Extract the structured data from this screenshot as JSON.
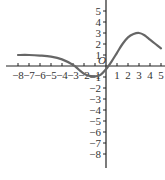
{
  "chart_data": {
    "type": "line",
    "title": "",
    "xlabel": "",
    "ylabel": "",
    "origin_label": "O",
    "xlim": [
      -8,
      5
    ],
    "ylim": [
      -8,
      5
    ],
    "x_ticks": [
      -8,
      -7,
      -6,
      -5,
      -4,
      -3,
      -2,
      -1,
      1,
      2,
      3,
      4,
      5
    ],
    "y_ticks": [
      -8,
      -7,
      -6,
      -5,
      -4,
      -3,
      -2,
      -1,
      1,
      2,
      3,
      4,
      5
    ],
    "grid": false,
    "series": [
      {
        "name": "f(x)",
        "x": [
          -8,
          -7,
          -6,
          -5,
          -4,
          -3,
          -2.5,
          -2,
          -1.5,
          -1,
          -0.5,
          0,
          0.5,
          1,
          1.5,
          2,
          2.5,
          3,
          3.5,
          4,
          4.5,
          5
        ],
        "y": [
          1,
          1,
          0.95,
          0.85,
          0.6,
          0.1,
          -0.3,
          -0.7,
          -0.9,
          -0.95,
          -0.8,
          -0.3,
          0.4,
          1.2,
          2.0,
          2.6,
          2.9,
          3.0,
          2.8,
          2.4,
          2.0,
          1.6
        ]
      }
    ],
    "color": "#555555"
  }
}
